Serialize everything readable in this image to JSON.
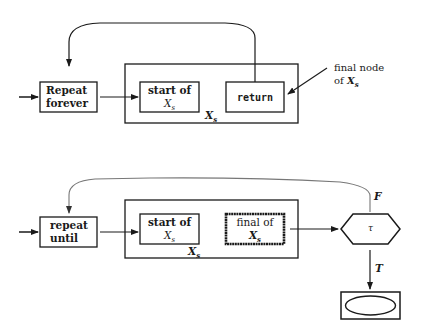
{
  "header": {
    "running_title": "5. STRUCTURED PROGRAM ANALYSIS",
    "page_number": "1"
  },
  "diagram_top": {
    "entry_label": "",
    "repeat_box": {
      "line1": "Repeat",
      "line2": "forever"
    },
    "start_box": {
      "line1": "start of",
      "line2": "X_s"
    },
    "return_box": {
      "label": "return"
    },
    "outer_box_label": "X_s",
    "annotation": {
      "line1": "final node",
      "line2": "of X_s"
    }
  },
  "diagram_bottom": {
    "repeat_box": {
      "line1": "repeat",
      "line2": "until"
    },
    "start_box": {
      "line1": "start of",
      "line2": "X_s"
    },
    "final_box": {
      "line1": "final of",
      "line2": "X_s"
    },
    "outer_box_label": "X_s",
    "condition": {
      "symbol": "τ"
    },
    "false_label": "F",
    "true_label": "T"
  },
  "colors": {
    "stroke": "#1a1a1a",
    "loop_curve_bottom": "#777777",
    "background": "#ffffff"
  }
}
